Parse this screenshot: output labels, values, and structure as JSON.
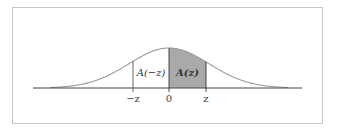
{
  "diagram": {
    "type": "normal-distribution-area",
    "title": "",
    "frame": {
      "x": 12,
      "y": 7,
      "w": 310,
      "h": 116,
      "stroke": "#c8c8c8"
    },
    "axis": {
      "y": 88,
      "x_start": 33,
      "x_end": 302,
      "color": "#444444"
    },
    "curve": {
      "center_x": 169,
      "sigma_px": 40,
      "peak_y": 48,
      "x_start": 50,
      "x_end": 288,
      "color": "#9a9a9a"
    },
    "shaded_region": {
      "from_x": 169,
      "to_x": 206,
      "fill": "#a9a9a9",
      "label": "A(z)"
    },
    "unshaded_region": {
      "from_x": 133,
      "to_x": 169,
      "label": "A(−z)"
    },
    "ticks": [
      {
        "x": 133,
        "label": "−z"
      },
      {
        "x": 169,
        "label": "0"
      },
      {
        "x": 206,
        "label": "z"
      }
    ]
  }
}
